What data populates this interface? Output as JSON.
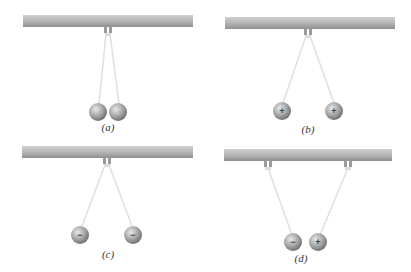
{
  "figure": {
    "colors": {
      "rod": "#b8b8b8",
      "rod_shadow": "#8f8f8f",
      "thread": "#e2e2e2",
      "ball": "#a0a0a0",
      "ball_highlight": "#e6e6e6",
      "ball_shadow": "#6e6e6e"
    },
    "panels": [
      {
        "id": "a",
        "label": "(a)",
        "balls": [
          {
            "charge": ""
          },
          {
            "charge": ""
          }
        ],
        "state": "neutral, touching"
      },
      {
        "id": "b",
        "label": "(b)",
        "balls": [
          {
            "charge": "+"
          },
          {
            "charge": "+"
          }
        ],
        "state": "like charges repel"
      },
      {
        "id": "c",
        "label": "(c)",
        "balls": [
          {
            "charge": "−"
          },
          {
            "charge": "−"
          }
        ],
        "state": "like charges repel"
      },
      {
        "id": "d",
        "label": "(d)",
        "balls": [
          {
            "charge": "−"
          },
          {
            "charge": "+"
          }
        ],
        "state": "unlike charges attract"
      }
    ]
  }
}
